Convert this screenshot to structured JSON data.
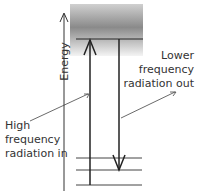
{
  "diagram": {
    "axis_label": "Energy",
    "labels": {
      "incoming": [
        "High",
        "frequency",
        "radiation in"
      ],
      "outgoing": [
        "Lower",
        "frequency",
        "radiation out"
      ]
    },
    "elements": {
      "upper_band": "shaded continuum of upper energy levels",
      "upper_level": "excited level",
      "lower_levels": 3,
      "up_arrow": "absorption (high frequency radiation in)",
      "down_arrow": "emission (lower frequency radiation out)"
    },
    "colors": {
      "line": "#222222",
      "band": "#888888",
      "text": "#333333"
    }
  }
}
